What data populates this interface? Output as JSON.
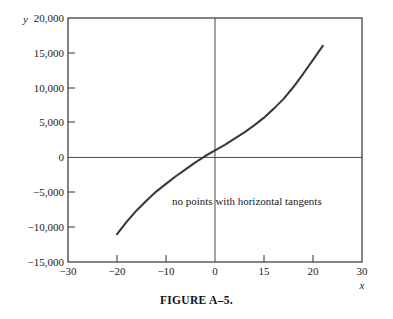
{
  "figure": {
    "caption": "FIGURE A–5.",
    "annotation": "no points with horizontal tangents",
    "x_axis_name": "x",
    "y_axis_name": "y"
  },
  "chart_data": {
    "type": "line",
    "title": "",
    "subtitle": "",
    "xlabel": "x",
    "ylabel": "y",
    "xlim": [
      -30,
      30
    ],
    "ylim": [
      -15000,
      20000
    ],
    "grid": false,
    "legend": "none",
    "xticks": [
      -30,
      -20,
      -10,
      0,
      15,
      20,
      30
    ],
    "xtick_labels": [
      "−30",
      "−20",
      "−10",
      "0",
      "15",
      "20",
      "30"
    ],
    "yticks": [
      20000,
      15000,
      10000,
      5000,
      0,
      -5000,
      -10000,
      -15000
    ],
    "ytick_labels": [
      "20,000",
      "15,000",
      "10,000",
      "5,000",
      "0",
      "−5,000",
      "−10,000",
      "−15,000"
    ],
    "axis_lines": {
      "x_axis_at_y": 0,
      "y_axis_at_x": 0
    },
    "annotations": [
      {
        "text": "no points with horizontal tangents",
        "x": 2,
        "y": -6500
      }
    ],
    "series": [
      {
        "name": "curve",
        "color": "#3a3a3a",
        "x": [
          -20,
          -18,
          -16,
          -14,
          -12,
          -10,
          -8,
          -6,
          -4,
          -2,
          0,
          2,
          4,
          6,
          8,
          10,
          12,
          14,
          16,
          18,
          20,
          22
        ],
        "y": [
          -11000,
          -9200,
          -7600,
          -6200,
          -4900,
          -3800,
          -2700,
          -1700,
          -700,
          200,
          1000,
          1800,
          2700,
          3600,
          4600,
          5700,
          7000,
          8400,
          10100,
          12000,
          14000,
          16000
        ]
      }
    ]
  }
}
